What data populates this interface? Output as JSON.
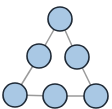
{
  "diagram": {
    "type": "triangle-node-graph",
    "colors": {
      "node_fill": "#a9c8e4",
      "node_stroke": "#1f2a36",
      "edge": "#9a9a9a",
      "background": "#ffffff"
    },
    "node_radius": 12,
    "nodes": [
      {
        "id": "top",
        "x": 60,
        "y": 19
      },
      {
        "id": "mid-left",
        "x": 39,
        "y": 56
      },
      {
        "id": "mid-right",
        "x": 77,
        "y": 57
      },
      {
        "id": "bottom-left",
        "x": 15,
        "y": 95
      },
      {
        "id": "bottom-middle",
        "x": 55,
        "y": 96
      },
      {
        "id": "bottom-right",
        "x": 96,
        "y": 96
      }
    ],
    "edges": [
      [
        "top",
        "mid-left"
      ],
      [
        "top",
        "mid-right"
      ],
      [
        "mid-left",
        "bottom-left"
      ],
      [
        "mid-right",
        "bottom-right"
      ],
      [
        "bottom-left",
        "bottom-middle"
      ],
      [
        "bottom-middle",
        "bottom-right"
      ]
    ]
  }
}
